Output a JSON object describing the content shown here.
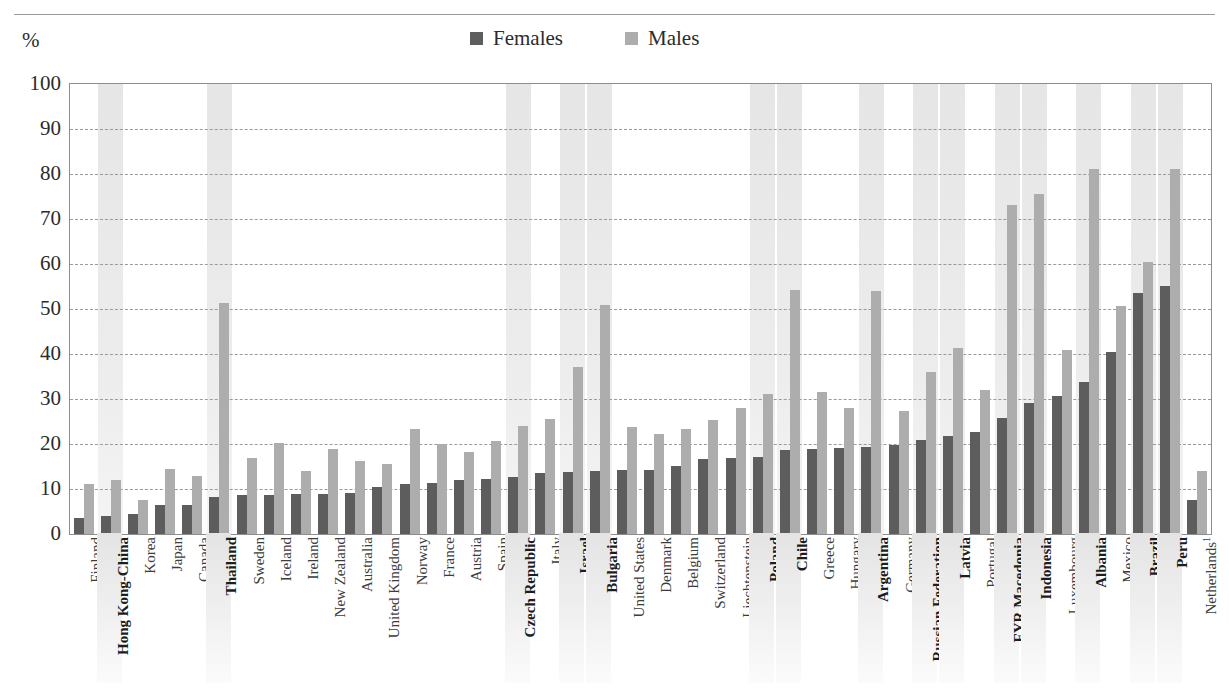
{
  "axis": {
    "unit_label": "%",
    "y_ticks": [
      "100",
      "90",
      "80",
      "70",
      "60",
      "50",
      "40",
      "30",
      "20",
      "10",
      "0"
    ],
    "y_min": 0,
    "y_max": 100
  },
  "legend": {
    "position": "top-center",
    "items": [
      {
        "label": "Females",
        "color": "#5d5d5d",
        "swatch": "square"
      },
      {
        "label": "Males",
        "color": "#adadad",
        "swatch": "square"
      }
    ]
  },
  "chart_data": {
    "type": "bar",
    "title": "",
    "subtitle": "",
    "xlabel": "",
    "ylabel": "%",
    "ylim": [
      0,
      100
    ],
    "ytick_step": 10,
    "grid": true,
    "legend_position": "top-center",
    "categories": [
      "Finland",
      "Hong Kong-China",
      "Korea",
      "Japan",
      "Canada",
      "Thailand",
      "Sweden",
      "Iceland",
      "Ireland",
      "New Zealand",
      "Australia",
      "United Kingdom",
      "Norway",
      "France",
      "Austria",
      "Spain",
      "Czech Republic",
      "Italy",
      "Israel",
      "Bulgaria",
      "United States",
      "Denmark",
      "Belgium",
      "Switzerland",
      "Liechtenstein",
      "Poland",
      "Chile",
      "Greece",
      "Hungary",
      "Argentina",
      "Germany",
      "Russian Federation",
      "Latvia",
      "Portugal",
      "FYR Macedonia",
      "Indonesia",
      "Luxembourg",
      "Albania",
      "Mexico",
      "Brazil",
      "Peru",
      "Netherlands¹"
    ],
    "highlighted_categories": [
      "Hong Kong-China",
      "Thailand",
      "Czech Republic",
      "Israel",
      "Bulgaria",
      "Poland",
      "Chile",
      "Argentina",
      "Russian Federation",
      "Latvia",
      "FYR Macedonia",
      "Indonesia",
      "Albania",
      "Brazil",
      "Peru"
    ],
    "series": [
      {
        "name": "Females",
        "color": "#5d5d5d",
        "values": [
          3.5,
          4.0,
          4.5,
          6.5,
          6.5,
          8.3,
          8.6,
          8.6,
          8.9,
          9.0,
          9.2,
          10.4,
          11.2,
          11.4,
          11.9,
          12.3,
          12.6,
          13.5,
          13.7,
          14.0,
          14.2,
          14.3,
          15.2,
          16.7,
          16.9,
          17.1,
          18.6,
          18.9,
          19.2,
          19.4,
          19.8,
          21.0,
          21.8,
          22.6,
          25.8,
          29.1,
          30.6,
          33.8,
          40.4,
          53.5,
          55.2,
          7.5
        ]
      },
      {
        "name": "Males",
        "color": "#adadad",
        "values": [
          11.1,
          12.0,
          7.6,
          14.5,
          12.9,
          51.3,
          17.0,
          20.2,
          13.9,
          18.8,
          16.2,
          15.6,
          23.4,
          20.0,
          18.3,
          20.7,
          24.0,
          25.5,
          37.2,
          50.9,
          23.7,
          22.3,
          23.4,
          25.4,
          27.9,
          31.2,
          54.2,
          31.5,
          28.0,
          54.0,
          27.4,
          35.9,
          41.4,
          32.1,
          73.2,
          75.5,
          40.9,
          81.2,
          50.6,
          60.5,
          81.1,
          14.0
        ]
      }
    ]
  }
}
